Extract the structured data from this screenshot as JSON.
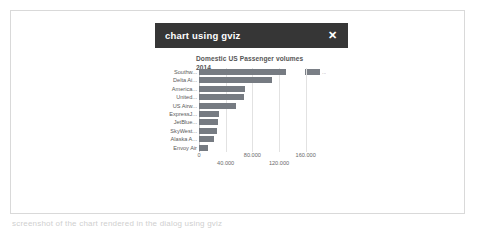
{
  "dialog": {
    "title": "chart using gviz",
    "close_label": "✕",
    "close_icon": "close-icon"
  },
  "page": {
    "clipped_caption": "screenshot of the chart rendered in the dialog using gviz"
  },
  "chart_data": {
    "type": "bar",
    "orientation": "horizontal",
    "title": "Domestic US Passenger volumes 2014",
    "title_line1": "Domestic US Passenger volumes",
    "title_line2": "2014",
    "xlabel": "",
    "ylabel": "",
    "categories": [
      "Southw...",
      "Delta Ai...",
      "America...",
      "United...",
      "US Airw...",
      "ExpressJ...",
      "JetBlue...",
      "SkyWest...",
      "Alaska A...",
      "Envoy Air"
    ],
    "values": [
      130000,
      110000,
      69000,
      68000,
      55000,
      30000,
      28000,
      27000,
      22000,
      14000
    ],
    "xlim": [
      0,
      192000
    ],
    "xticks": [
      0,
      40000,
      80000,
      120000,
      160000
    ],
    "xtick_labels": [
      "0",
      "40.000",
      "80.000",
      "120.000",
      "160.000"
    ],
    "grid": true,
    "legend": {
      "position": "top-right",
      "label": "...",
      "swatch_color": "#7a7f86"
    },
    "bar_color": "#767b82"
  }
}
